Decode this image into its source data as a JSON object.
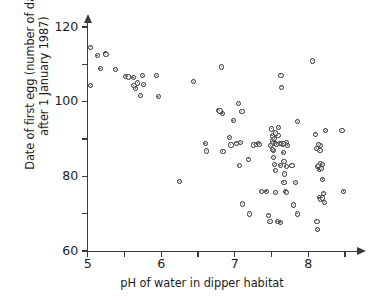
{
  "chart_data": {
    "type": "scatter",
    "title": "",
    "xlabel": "pH of water in dipper habitat",
    "ylabel": "Date of first egg (number of days\nafter 1 January 1987)",
    "xlim": [
      4.85,
      8.6
    ],
    "ylim": [
      60,
      122
    ],
    "grid": false,
    "legend": null,
    "x_ticks_major": [
      "5",
      "6",
      "7",
      "8"
    ],
    "x_ticks_major_values": [
      5,
      6,
      7,
      8
    ],
    "x_ticks_minor_values": [
      5.5,
      6.5,
      7.5,
      8.5
    ],
    "y_ticks_major": [
      "60",
      "80",
      "100",
      "120"
    ],
    "y_ticks_major_values": [
      60,
      80,
      100,
      120
    ],
    "y_ticks_minor_values": [
      70,
      90,
      110
    ],
    "marker": "open-circle",
    "marker_color": "#2e2e2e",
    "axis_color": "#3a3a3a",
    "n_points": 108,
    "points": [
      [
        5.04,
        114.6
      ],
      [
        5.04,
        104.3
      ],
      [
        5.13,
        112.3
      ],
      [
        5.17,
        108.8
      ],
      [
        5.24,
        113.0
      ],
      [
        5.25,
        112.6
      ],
      [
        5.38,
        108.6
      ],
      [
        5.52,
        106.8
      ],
      [
        5.55,
        106.6
      ],
      [
        5.62,
        106.5
      ],
      [
        5.63,
        104.3
      ],
      [
        5.65,
        103.6
      ],
      [
        5.68,
        105.0
      ],
      [
        5.72,
        101.6
      ],
      [
        5.75,
        107.0
      ],
      [
        5.76,
        104.6
      ],
      [
        5.94,
        106.9
      ],
      [
        5.96,
        101.4
      ],
      [
        6.25,
        78.6
      ],
      [
        6.44,
        105.4
      ],
      [
        6.6,
        88.7
      ],
      [
        6.62,
        86.8
      ],
      [
        6.78,
        97.6
      ],
      [
        6.8,
        97.5
      ],
      [
        6.82,
        109.3
      ],
      [
        6.83,
        96.9
      ],
      [
        6.84,
        86.7
      ],
      [
        6.93,
        90.4
      ],
      [
        6.95,
        88.4
      ],
      [
        6.98,
        94.9
      ],
      [
        7.05,
        99.5
      ],
      [
        7.06,
        82.9
      ],
      [
        7.08,
        89.0
      ],
      [
        7.1,
        97.3
      ],
      [
        7.11,
        72.6
      ],
      [
        7.19,
        84.6
      ],
      [
        7.2,
        69.9
      ],
      [
        7.26,
        88.4
      ],
      [
        7.3,
        88.6
      ],
      [
        7.32,
        88.8
      ],
      [
        7.34,
        88.6
      ],
      [
        7.36,
        75.9
      ],
      [
        7.43,
        76.0
      ],
      [
        7.46,
        69.6
      ],
      [
        7.48,
        67.8
      ],
      [
        7.5,
        92.7
      ],
      [
        7.51,
        90.8
      ],
      [
        7.52,
        89.5
      ],
      [
        7.52,
        88.8
      ],
      [
        7.53,
        86.9
      ],
      [
        7.53,
        85.0
      ],
      [
        7.54,
        83.1
      ],
      [
        7.55,
        81.6
      ],
      [
        7.55,
        88.9
      ],
      [
        7.56,
        75.6
      ],
      [
        7.58,
        67.8
      ],
      [
        7.6,
        93.0
      ],
      [
        7.61,
        88.9
      ],
      [
        7.62,
        82.8
      ],
      [
        7.62,
        67.7
      ],
      [
        7.63,
        107.1
      ],
      [
        7.64,
        103.9
      ],
      [
        7.65,
        88.5
      ],
      [
        7.66,
        86.3
      ],
      [
        7.67,
        84.0
      ],
      [
        7.68,
        80.6
      ],
      [
        7.69,
        76.0
      ],
      [
        7.7,
        75.6
      ],
      [
        7.71,
        89.0
      ],
      [
        7.72,
        88.3
      ],
      [
        7.78,
        83.0
      ],
      [
        7.8,
        72.3
      ],
      [
        7.83,
        78.3
      ],
      [
        7.85,
        69.9
      ],
      [
        7.86,
        94.6
      ],
      [
        8.06,
        110.9
      ],
      [
        8.1,
        91.3
      ],
      [
        8.12,
        87.4
      ],
      [
        8.13,
        82.6
      ],
      [
        8.14,
        83.0
      ],
      [
        8.15,
        81.9
      ],
      [
        8.15,
        74.3
      ],
      [
        8.16,
        86.9
      ],
      [
        8.16,
        88.2
      ],
      [
        8.17,
        73.9
      ],
      [
        8.18,
        82.1
      ],
      [
        8.19,
        74.2
      ],
      [
        8.2,
        79.2
      ],
      [
        8.21,
        75.5
      ],
      [
        8.22,
        73.0
      ],
      [
        8.12,
        68.0
      ],
      [
        8.13,
        65.7
      ],
      [
        8.24,
        92.2
      ],
      [
        8.46,
        92.2
      ],
      [
        8.48,
        76.0
      ],
      [
        7.02,
        88.9
      ],
      [
        7.57,
        88.6
      ],
      [
        7.59,
        90.9
      ],
      [
        7.64,
        88.9
      ],
      [
        7.66,
        88.8
      ],
      [
        7.54,
        90.2
      ],
      [
        7.56,
        91.6
      ],
      [
        8.17,
        83.4
      ],
      [
        8.19,
        83.1
      ],
      [
        8.14,
        88.5
      ],
      [
        7.67,
        78.4
      ],
      [
        7.49,
        88.2
      ],
      [
        7.51,
        87.2
      ],
      [
        7.7,
        82.7
      ]
    ]
  },
  "figure": {
    "background": "#ffffff"
  }
}
